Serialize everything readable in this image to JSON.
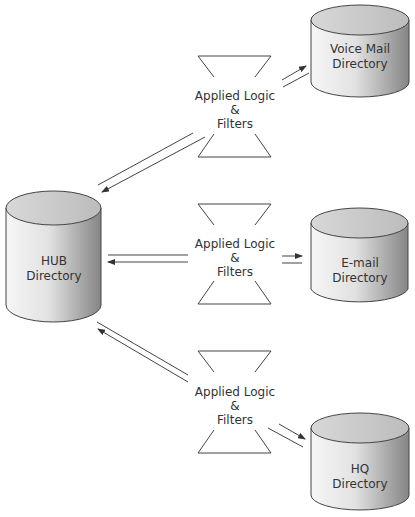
{
  "diagram": {
    "hub": {
      "line1": "HUB",
      "line2": "Directory"
    },
    "directories": [
      {
        "id": "voicemail",
        "line1": "Voice Mail",
        "line2": "Directory"
      },
      {
        "id": "email",
        "line1": "E-mail",
        "line2": "Directory"
      },
      {
        "id": "hq",
        "line1": "HQ",
        "line2": "Directory"
      }
    ],
    "filters": [
      {
        "line1": "Applied Logic",
        "line2": "&",
        "line3": "Filters"
      },
      {
        "line1": "Applied Logic",
        "line2": "&",
        "line3": "Filters"
      },
      {
        "line1": "Applied Logic",
        "line2": "&",
        "line3": "Filters"
      }
    ],
    "colors": {
      "cylinder_light": "#f6f6f6",
      "cylinder_dark": "#858585",
      "cylinder_top": "#c9c9c9",
      "outline": "#444444",
      "text": "#333333"
    }
  }
}
